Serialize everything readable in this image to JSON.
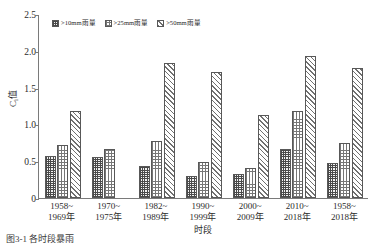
{
  "chart_data": {
    "type": "bar",
    "title": "",
    "xlabel": "时段",
    "ylabel": "C<sub>i</sub>值",
    "ylabel_main": "C",
    "ylabel_sub": "i",
    "ylabel_tail": "值",
    "ylim": [
      0,
      2.5
    ],
    "ytick_labels": [
      "2.5",
      "2.0",
      "1.5",
      "1.0",
      "0.5",
      "0"
    ],
    "ytick_values": [
      2.5,
      2.0,
      1.5,
      1.0,
      0.5,
      0
    ],
    "grid": false,
    "legend_position": "top-left-inside",
    "categories": [
      "1958~1969年",
      "1970~1975年",
      "1982~1989年",
      "1990~1999年",
      "2000~2009年",
      "2010~2018年",
      "1958~2018年"
    ],
    "category_lines": [
      [
        "1958~",
        "1969年"
      ],
      [
        "1970~",
        "1975年"
      ],
      [
        "1982~",
        "1989年"
      ],
      [
        "1990~",
        "1999年"
      ],
      [
        "2000~",
        "2009年"
      ],
      [
        "2010~",
        "2018年"
      ],
      [
        "1958~",
        "2018年"
      ]
    ],
    "series": [
      {
        "name": ">10mm雨量",
        "pattern": "dark-checker",
        "values": [
          0.57,
          0.56,
          0.44,
          0.3,
          0.33,
          0.67,
          0.47
        ]
      },
      {
        "name": ">25mm雨量",
        "pattern": "fine-grid",
        "values": [
          0.72,
          0.66,
          0.77,
          0.49,
          0.41,
          1.18,
          0.75
        ]
      },
      {
        "name": ">50mm雨量",
        "pattern": "diagonal-hatch",
        "values": [
          1.18,
          null,
          1.84,
          1.71,
          1.13,
          1.93,
          1.77
        ]
      }
    ]
  },
  "caption": "图3-1  各时段暴雨",
  "colors": {
    "axis": "#7a7a7a",
    "bar_border": "#585858",
    "text": "#2b2b2b"
  }
}
